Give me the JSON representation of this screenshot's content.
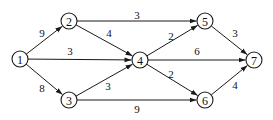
{
  "diagram": {
    "type": "directed-weighted-network",
    "node_radius": 8,
    "colors": {
      "stroke": "#1a1a1a",
      "text": "#111111",
      "background": "#ffffff"
    },
    "nodes": [
      {
        "id": "1",
        "label": "1",
        "x": 20,
        "y": 59
      },
      {
        "id": "2",
        "label": "2",
        "x": 69,
        "y": 21
      },
      {
        "id": "3",
        "label": "3",
        "x": 69,
        "y": 100
      },
      {
        "id": "4",
        "label": "4",
        "x": 140,
        "y": 60
      },
      {
        "id": "5",
        "label": "5",
        "x": 205,
        "y": 21
      },
      {
        "id": "6",
        "label": "6",
        "x": 205,
        "y": 100
      },
      {
        "id": "7",
        "label": "7",
        "x": 254,
        "y": 60
      }
    ],
    "edges": [
      {
        "from": "1",
        "to": "2",
        "weight": "9",
        "lx": 42,
        "ly": 33
      },
      {
        "from": "1",
        "to": "4",
        "weight": "3",
        "lx": 70,
        "ly": 51
      },
      {
        "from": "1",
        "to": "3",
        "weight": "8",
        "lx": 42,
        "ly": 88
      },
      {
        "from": "2",
        "to": "5",
        "weight": "3",
        "lx": 137,
        "ly": 15
      },
      {
        "from": "2",
        "to": "4",
        "weight": "4",
        "lx": 109,
        "ly": 33
      },
      {
        "from": "3",
        "to": "4",
        "weight": "3",
        "lx": 108,
        "ly": 86
      },
      {
        "from": "3",
        "to": "6",
        "weight": "9",
        "lx": 137,
        "ly": 109
      },
      {
        "from": "4",
        "to": "5",
        "weight": "2",
        "lx": 171,
        "ly": 36
      },
      {
        "from": "4",
        "to": "7",
        "weight": "6",
        "lx": 197,
        "ly": 51
      },
      {
        "from": "4",
        "to": "6",
        "weight": "2",
        "lx": 171,
        "ly": 74
      },
      {
        "from": "5",
        "to": "7",
        "weight": "3",
        "lx": 235,
        "ly": 33
      },
      {
        "from": "6",
        "to": "7",
        "weight": "4",
        "lx": 235,
        "ly": 85
      }
    ]
  }
}
